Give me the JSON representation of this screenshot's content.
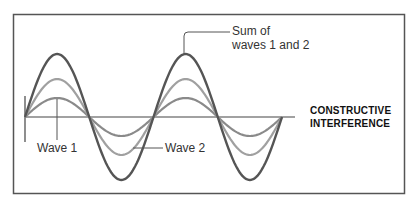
{
  "diagram": {
    "caption_line1": "CONSTRUCTIVE",
    "caption_line2": "INTERFERENCE",
    "labels": {
      "wave1": "Wave 1",
      "wave2": "Wave 2",
      "sum_line1": "Sum of",
      "sum_line2": "waves 1 and 2"
    },
    "colors": {
      "frame": "#555555",
      "sum_wave": "#555555",
      "wave2": "#9a9a9a",
      "wave1": "#8a8a8a",
      "axis": "#444444"
    },
    "waves": [
      {
        "name": "Wave 1",
        "relative_amplitude": 1.0
      },
      {
        "name": "Wave 2",
        "relative_amplitude": 1.9
      },
      {
        "name": "Sum of waves 1 and 2",
        "relative_amplitude": 3.3
      }
    ],
    "cycles_shown": 2
  }
}
